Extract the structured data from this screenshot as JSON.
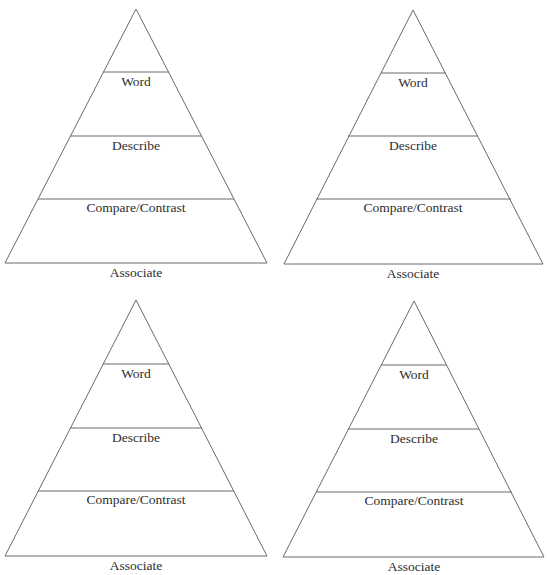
{
  "header": {
    "cutoff_text": "...ing your vocabulary"
  },
  "pyramid_levels": [
    "Word",
    "Describe",
    "Compare/Contrast",
    "Associate"
  ],
  "pyramids": [
    {
      "id": "top-left",
      "apex": [
        136,
        9
      ],
      "base_left": [
        5,
        263
      ],
      "base_right": [
        267,
        263
      ]
    },
    {
      "id": "top-right",
      "apex": [
        413,
        10
      ],
      "base_left": [
        284,
        264
      ],
      "base_right": [
        543,
        264
      ]
    },
    {
      "id": "bottom-left",
      "apex": [
        136,
        300
      ],
      "base_left": [
        5,
        556
      ],
      "base_right": [
        267,
        556
      ]
    },
    {
      "id": "bottom-right",
      "apex": [
        414,
        301
      ],
      "base_left": [
        283,
        557
      ],
      "base_right": [
        544,
        557
      ]
    }
  ],
  "labels": {
    "word": "Word",
    "describe": "Describe",
    "compare": "Compare/Contrast",
    "associate": "Associate"
  },
  "colors": {
    "line": "#6a6a6a",
    "text": "#2e2e2e",
    "background": "#ffffff"
  }
}
